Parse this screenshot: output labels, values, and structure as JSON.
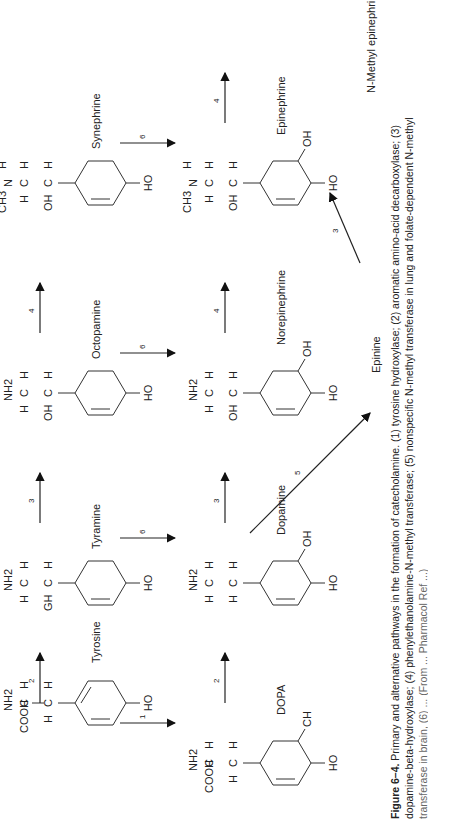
{
  "figure": {
    "compounds": [
      {
        "id": "tyrosine",
        "name": "Tyrosine",
        "substituents": [
          "HO",
          "H",
          "H",
          "COOH",
          "NH2",
          "H"
        ]
      },
      {
        "id": "tyramine",
        "name": "Tyramine",
        "substituents": [
          "HO",
          "GH",
          "H",
          "H",
          "H",
          "NH2"
        ]
      },
      {
        "id": "octopamine",
        "name": "Octopamine",
        "substituents": [
          "HO",
          "OH",
          "H",
          "H",
          "H",
          "NH2"
        ]
      },
      {
        "id": "synephrine",
        "name": "Synephrine",
        "substituents": [
          "HO",
          "OH",
          "H",
          "H",
          "H",
          "N",
          "CH3",
          "H"
        ]
      },
      {
        "id": "dopa",
        "name": "DOPA",
        "substituents": [
          "HO",
          "CH",
          "H",
          "H",
          "COOH",
          "H",
          "NH2"
        ]
      },
      {
        "id": "dopamine",
        "name": "Dopamine",
        "substituents": [
          "HO",
          "OH",
          "H",
          "H",
          "H",
          "H",
          "NH2"
        ]
      },
      {
        "id": "norepinephrine",
        "name": "Norepinephrine",
        "substituents": [
          "HO",
          "OH",
          "OH",
          "H",
          "H",
          "H",
          "NH2"
        ]
      },
      {
        "id": "epinephrine",
        "name": "Epinephrine",
        "substituents": [
          "HO",
          "OH",
          "OH",
          "H",
          "H",
          "H",
          "N",
          "CH3",
          "H"
        ]
      },
      {
        "id": "epinine",
        "name": "Epinine",
        "substituents": [
          "HO",
          "OH",
          "H",
          "H",
          "H",
          "H",
          "N",
          "CH3",
          "H"
        ]
      },
      {
        "id": "n_methyl_epinephrine",
        "name": "N-Methyl epinephrine",
        "substituents": [
          "HO",
          "OH",
          "OH",
          "H",
          "H",
          "H",
          "N",
          "CH3",
          "CH3"
        ]
      }
    ],
    "arrows": [
      {
        "from": "tyrosine",
        "to": "dopa",
        "enzyme": "1"
      },
      {
        "from": "tyrosine",
        "to": "tyramine",
        "enzyme": "2"
      },
      {
        "from": "dopa",
        "to": "dopamine",
        "enzyme": "2"
      },
      {
        "from": "tyramine",
        "to": "dopamine",
        "enzyme": "6"
      },
      {
        "from": "tyramine",
        "to": "octopamine",
        "enzyme": "3"
      },
      {
        "from": "dopamine",
        "to": "norepinephrine",
        "enzyme": "3"
      },
      {
        "from": "octopamine",
        "to": "norepinephrine",
        "enzyme": "6"
      },
      {
        "from": "octopamine",
        "to": "synephrine",
        "enzyme": "4"
      },
      {
        "from": "norepinephrine",
        "to": "epinephrine",
        "enzyme": "4"
      },
      {
        "from": "synephrine",
        "to": "epinephrine",
        "enzyme": "6"
      },
      {
        "from": "dopamine",
        "to": "epinine",
        "enzyme": "5"
      },
      {
        "from": "epinine",
        "to": "epinephrine",
        "enzyme": "3"
      },
      {
        "from": "epinephrine",
        "to": "n_methyl_epinephrine",
        "enzyme": "4"
      }
    ],
    "atoms": {
      "HO": "HO",
      "OH": "OH",
      "H": "H",
      "C": "C",
      "N": "N",
      "CH3": "CH3",
      "NH2": "NH2",
      "COOH": "COOH",
      "GH": "GH",
      "CH": "CH"
    },
    "caption": {
      "label": "Figure 6–4.",
      "line1": " Primary and alternative pathways in the formation of catecholamine. (1) tyrosine hydroxylase; (2) aromatic amino-acid decarboxylase; (3)",
      "line2": "dopamine-beta-hydroxylase; (4) phenylethanolamine-N-methyl transferase; (5) nonspecific N-methyl transferase in lung and folate-dependent N-methyl",
      "line3": "transferase in brain, (6) ... (From ... Pharmacol Ref ...)"
    }
  }
}
